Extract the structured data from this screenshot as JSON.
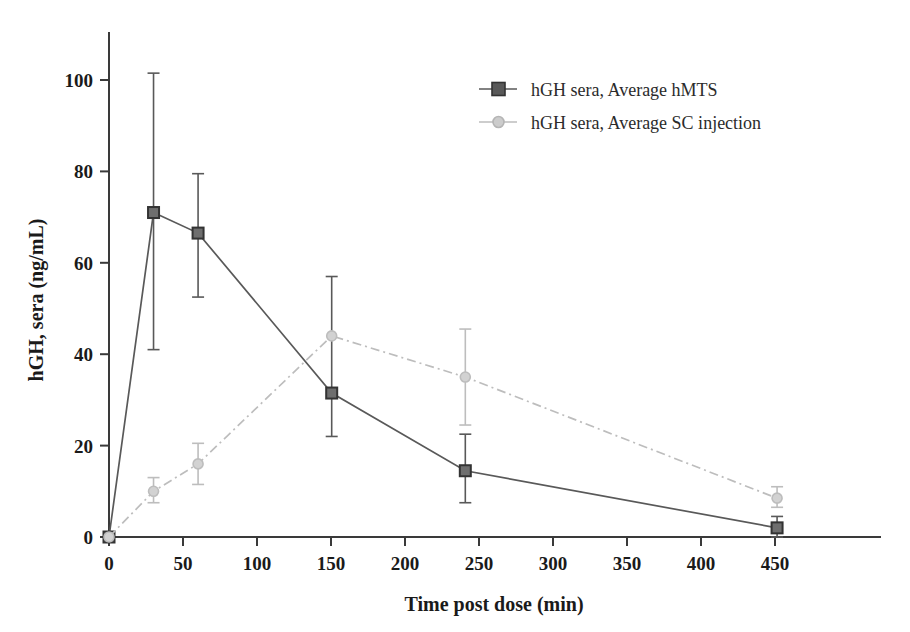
{
  "chart_data": {
    "type": "line",
    "title": "",
    "xlabel": "Time post dose (min)",
    "ylabel": "hGH, sera (ng/mL)",
    "xlim": [
      0,
      520
    ],
    "ylim": [
      0,
      110
    ],
    "xticks": [
      0,
      50,
      100,
      150,
      200,
      250,
      300,
      350,
      400,
      450
    ],
    "yticks": [
      0,
      20,
      40,
      60,
      80,
      100
    ],
    "grid": false,
    "legend_position": "upper-center",
    "x": [
      0,
      30,
      60,
      150,
      240,
      450
    ],
    "series": [
      {
        "name": "hGH sera, Average hMTS",
        "color": "#595959",
        "marker": "square",
        "linestyle": "solid",
        "x": [
          0,
          30,
          60,
          150,
          240,
          450
        ],
        "values": [
          0,
          71,
          66.5,
          31.5,
          14.5,
          2
        ],
        "error_upper": [
          0,
          101.5,
          79.5,
          57,
          22.5,
          4.5
        ],
        "error_lower": [
          0,
          41,
          52.5,
          22,
          7.5,
          0
        ]
      },
      {
        "name": "hGH sera, Average SC injection",
        "color": "#bdbdbd",
        "marker": "circle",
        "linestyle": "dashdot",
        "x": [
          0,
          30,
          60,
          150,
          240,
          450
        ],
        "values": [
          0,
          10,
          16,
          44,
          35,
          8.5
        ],
        "error_upper": [
          0,
          13,
          20.5,
          44,
          45.5,
          11
        ],
        "error_lower": [
          0,
          7.5,
          11.5,
          44,
          24.5,
          6.5
        ]
      }
    ]
  },
  "axes": {
    "xlabel": "Time post dose (min)",
    "ylabel": "hGH, sera (ng/mL)",
    "xticks": [
      "0",
      "50",
      "100",
      "150",
      "200",
      "250",
      "300",
      "350",
      "400",
      "450"
    ],
    "yticks": [
      "0",
      "20",
      "40",
      "60",
      "80",
      "100"
    ]
  },
  "legend": {
    "entries": [
      {
        "label": "hGH sera, Average hMTS",
        "color": "#595959",
        "marker": "square"
      },
      {
        "label": "hGH sera, Average SC injection",
        "color": "#bdbdbd",
        "marker": "circle"
      }
    ]
  },
  "colors": {
    "series_hmts": "#595959",
    "series_sc": "#bdbdbd",
    "axis": "#3a3a3a",
    "text": "#1a1a1a",
    "background": "#ffffff"
  }
}
